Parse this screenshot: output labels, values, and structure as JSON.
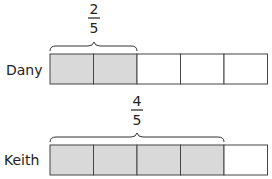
{
  "diagram": {
    "type": "fraction-bar-model",
    "cells_per_bar": 5,
    "colors": {
      "shaded": "#d9d9d9",
      "unshaded": "#ffffff",
      "stroke": "#444444"
    },
    "bars": [
      {
        "label": "Dany",
        "shaded": 2,
        "fraction": {
          "numerator": "2",
          "denominator": "5"
        }
      },
      {
        "label": "Keith",
        "shaded": 4,
        "fraction": {
          "numerator": "4",
          "denominator": "5"
        }
      }
    ]
  }
}
